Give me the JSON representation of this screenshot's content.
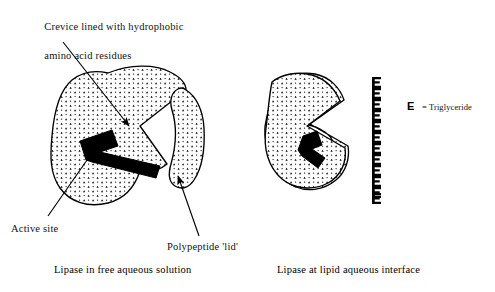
{
  "figure": {
    "title_text": "Lipase conformational change at the lipid-aqueous interface",
    "labels": {
      "crevice_line1": "Crevice lined with hydrophobic",
      "crevice_line2": "amino acid residues",
      "active_site": "Active site",
      "lid": "Polypeptide 'lid'"
    },
    "captions": {
      "left": "Lipase in free aqueous solution",
      "right": "Lipase at lipid aqueous interface"
    },
    "legend": {
      "symbol": "E",
      "equals": "=",
      "text": "= Triglyceride",
      "term": "Triglyceride"
    },
    "panels": [
      {
        "id": "left-panel",
        "name": "lipase-free-aqueous",
        "caption": "Lipase in free aqueous solution",
        "state": "closed",
        "parts": [
          "protein-body",
          "polypeptide-lid",
          "active-site",
          "crevice"
        ]
      },
      {
        "id": "right-panel",
        "name": "lipase-lipid-interface",
        "caption": "Lipase at lipid aqueous interface",
        "state": "open",
        "parts": [
          "protein-body-open",
          "active-site",
          "triglyceride-interface"
        ]
      }
    ],
    "triglyceride_column": {
      "count": 12,
      "symbol": "E",
      "orientation": "vertical"
    },
    "colors": {
      "ink": "#000000",
      "background": "#ffffff",
      "stipple": "#000000"
    }
  }
}
